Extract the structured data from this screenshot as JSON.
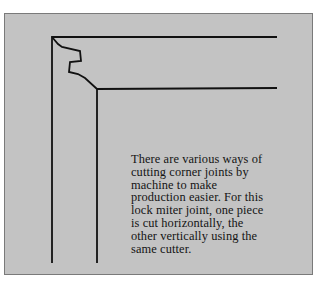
{
  "figure": {
    "caption_lines": [
      "There are various ways of",
      "cutting corner joints by",
      "machine to make",
      "production easier. For this",
      "lock miter joint, one piece",
      "is cut horizontally, the",
      "other vertically using the",
      "same cutter."
    ]
  },
  "colors": {
    "panel_background": "#c3c3c3",
    "line": "#111111",
    "text": "#141414"
  }
}
